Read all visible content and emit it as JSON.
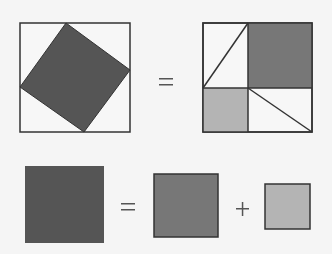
{
  "colors": {
    "background": "#f5f5f5",
    "outline": "#333333",
    "hypotenuse_square": "#555555",
    "long_leg_square": "#777777",
    "short_leg_square": "#b4b4b4",
    "triangle_fill": "#f7f7f7"
  },
  "top_row": {
    "left_figure": "tilted square (c²) inside outer square with four right triangles",
    "operator": "=",
    "right_figure": "outer square split into a² square, b² square and four right triangles"
  },
  "bottom_row": {
    "operator_equals": "=",
    "operator_plus": "+",
    "terms": [
      "c-squared",
      "a-squared",
      "b-squared"
    ]
  }
}
